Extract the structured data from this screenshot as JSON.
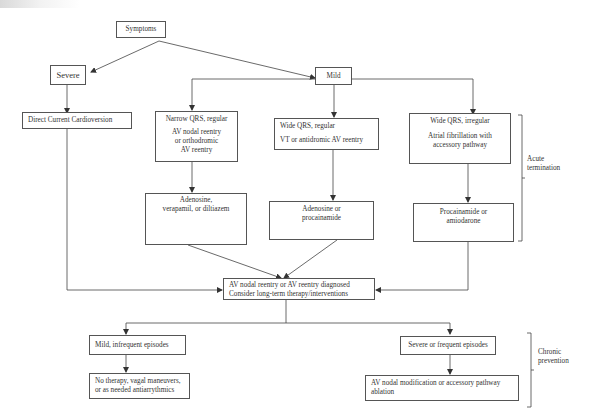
{
  "diagram": {
    "nodes": {
      "symptoms": {
        "label": "Symptoms"
      },
      "severe": {
        "label": "Severe"
      },
      "mild": {
        "label": "Mild"
      },
      "dc_cardioversion": {
        "label": "Direct Current Cardioversion"
      },
      "narrow_qrs": {
        "title": "Narrow QRS, regular",
        "line1": "AV nodal reentry",
        "line2": "or orthodromic",
        "line3": "AV reentry"
      },
      "wide_qrs_regular": {
        "title": "Wide QRS, regular",
        "line1": "VT or antidromic AV reentry"
      },
      "wide_qrs_irregular": {
        "title": "Wide QRS, irregular",
        "line1": "Atrial fibrillation with",
        "line2": "accessory pathway"
      },
      "adenosine_verapamil": {
        "line1": "Adenosine,",
        "line2": "verapamil, or diltiazem"
      },
      "adenosine_procainamide": {
        "line1": "Adenosine or",
        "line2": "procainamide"
      },
      "procainamide_amiodarone": {
        "line1": "Procainamide or",
        "line2": "amiodarone"
      },
      "diagnosed": {
        "line1": "AV nodal reentry or AV reentry diagnosed",
        "line2": "Consider long-term therapy/interventions"
      },
      "mild_infrequent": {
        "label": "Mild, infrequent episodes"
      },
      "severe_frequent": {
        "label": "Severe or frequent episodes"
      },
      "no_therapy": {
        "line1": "No therapy, vagal maneuvers,",
        "line2": "or as needed antiarrythmics"
      },
      "ablation": {
        "line1": "AV nodal modification or accessory pathway",
        "line2": "ablation"
      }
    },
    "brackets": {
      "acute": {
        "line1": "Acute",
        "line2": "termination"
      },
      "chronic": {
        "line1": "Chronic",
        "line2": "prevention"
      }
    },
    "colors": {
      "line": "#444444",
      "box_border": "#555555",
      "text": "#333333"
    }
  }
}
